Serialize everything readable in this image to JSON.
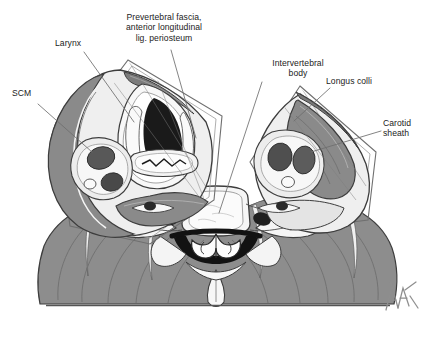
{
  "figure": {
    "signature": "AH",
    "background_color": "#ffffff",
    "palette": {
      "outline": "#3b3b3b",
      "muscle_gray": "#8d8d8d",
      "muscle_dark": "#6e6e6e",
      "fascia_light": "#e9e9e9",
      "tissue_pale": "#f2f2f2",
      "lumen_black": "#1a1a1a",
      "vessel_dark": "#4a4a4a",
      "leader_line": "#6a6a6a",
      "baseline": "#555555",
      "text": "#1b1b1b"
    }
  },
  "labels": [
    {
      "id": "scm",
      "name": "label-scm",
      "text": "SCM",
      "align": "left",
      "x": 12,
      "y": 88,
      "leader": {
        "x1": 38,
        "y1": 104,
        "x2": 92,
        "y2": 152
      }
    },
    {
      "id": "larynx",
      "name": "label-larynx",
      "text": "Larynx",
      "align": "left",
      "x": 55,
      "y": 38,
      "leader": {
        "x1": 84,
        "y1": 52,
        "x2": 134,
        "y2": 122
      }
    },
    {
      "id": "prevertebral-fascia",
      "name": "label-prevertebral-fascia",
      "text": "Prevertebral fascia,\nanterior longitudinal\nlig. periosteum",
      "align": "center",
      "x": 104,
      "y": 12,
      "leader": {
        "x1": 171,
        "y1": 50,
        "x2": 196,
        "y2": 138
      }
    },
    {
      "id": "intervertebral-body",
      "name": "label-intervertebral-body",
      "text": "Intervertebral\nbody",
      "align": "center",
      "x": 238,
      "y": 58,
      "leader": {
        "x1": 262,
        "y1": 82,
        "x2": 219,
        "y2": 213
      }
    },
    {
      "id": "longus-colli",
      "name": "label-longus-colli",
      "text": "Longus colli",
      "align": "left",
      "x": 326,
      "y": 76,
      "leader": {
        "x1": 330,
        "y1": 88,
        "x2": 294,
        "y2": 121
      }
    },
    {
      "id": "carotid-sheath",
      "name": "label-carotid-sheath",
      "text": "Carotid\nsheath",
      "align": "left",
      "x": 383,
      "y": 118,
      "leader": {
        "x1": 381,
        "y1": 131,
        "x2": 311,
        "y2": 152
      }
    }
  ],
  "structures": {
    "left_block": "Left cervical fascial block containing SCM, larynx, carotid sheath and esophagus",
    "right_block": "Right cervical fascial block containing longus colli and carotid sheath",
    "center": "Cervical vertebra with vertebral body, spinal canal and spinal cord",
    "base": "Posterior trapezius / paraspinal muscle mass on flat baseline"
  }
}
